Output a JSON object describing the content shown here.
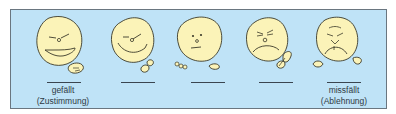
{
  "figure": {
    "type": "rating-scale",
    "colors": {
      "background": "#bfe3f7",
      "face_fill": "#fbf3b8",
      "stroke": "#3b3a2a",
      "border": "#6a7680"
    },
    "items": [
      {
        "id": "1",
        "expression": "very-happy",
        "label_1": "gefällt",
        "label_2": "(Zustimmung)"
      },
      {
        "id": "2",
        "expression": "happy",
        "label_1": "",
        "label_2": ""
      },
      {
        "id": "3",
        "expression": "neutral",
        "label_1": "",
        "label_2": ""
      },
      {
        "id": "4",
        "expression": "unhappy",
        "label_1": "",
        "label_2": ""
      },
      {
        "id": "5",
        "expression": "very-unhappy",
        "label_1": "missfällt",
        "label_2": "(Ablehnung)"
      }
    ]
  }
}
